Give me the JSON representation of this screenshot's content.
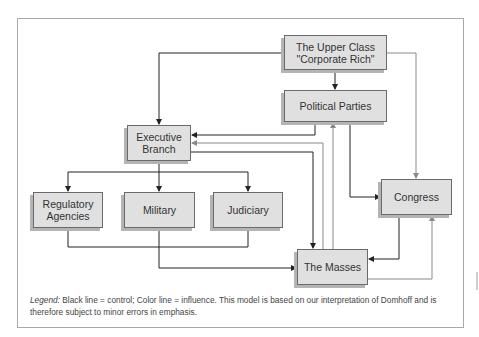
{
  "diagram": {
    "nodes": {
      "upper_class": {
        "line1": "The Upper Class",
        "line2": "\"Corporate Rich\""
      },
      "political_parties": {
        "label": "Political Parties"
      },
      "executive": {
        "line1": "Executive",
        "line2": "Branch"
      },
      "regulatory": {
        "line1": "Regulatory",
        "line2": "Agencies"
      },
      "military": {
        "label": "Military"
      },
      "judiciary": {
        "label": "Judiciary"
      },
      "congress": {
        "label": "Congress"
      },
      "masses": {
        "label": "The Masses"
      }
    },
    "edges": [
      {
        "from": "upper_class",
        "to": "executive",
        "type": "control"
      },
      {
        "from": "upper_class",
        "to": "political_parties",
        "type": "control"
      },
      {
        "from": "upper_class",
        "to": "congress",
        "type": "influence"
      },
      {
        "from": "political_parties",
        "to": "executive",
        "type": "control"
      },
      {
        "from": "political_parties",
        "to": "congress",
        "type": "control"
      },
      {
        "from": "masses",
        "to": "executive",
        "type": "influence"
      },
      {
        "from": "masses",
        "to": "political_parties",
        "type": "influence"
      },
      {
        "from": "executive",
        "to": "masses",
        "type": "control"
      },
      {
        "from": "executive",
        "to": "regulatory",
        "type": "control"
      },
      {
        "from": "executive",
        "to": "military",
        "type": "control"
      },
      {
        "from": "executive",
        "to": "judiciary",
        "type": "control"
      },
      {
        "from": "regulatory",
        "to": "masses",
        "type": "control"
      },
      {
        "from": "judiciary",
        "to": "masses",
        "type": "control"
      },
      {
        "from": "military",
        "to": "masses",
        "type": "control"
      },
      {
        "from": "congress",
        "to": "masses",
        "type": "control"
      },
      {
        "from": "masses",
        "to": "congress",
        "type": "influence"
      }
    ],
    "colors": {
      "control": "#222222",
      "influence": "#8a8a8a",
      "box_fill": "#e0e0e0"
    }
  },
  "legend": {
    "label": "Legend:",
    "text": " Black line = control; Color line = influence. This model is based on our interpretation of Domhoff and is therefore subject to minor errors in emphasis."
  }
}
